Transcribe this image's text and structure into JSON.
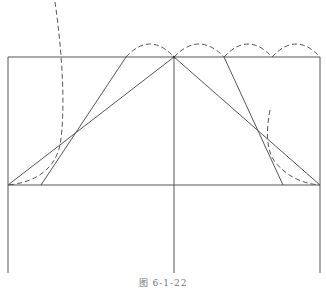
{
  "figure": {
    "caption": "图 6-1-22",
    "stroke_color": "#555555",
    "dash_color": "#555555",
    "frame": {
      "left": 8,
      "right": 320,
      "top": 57,
      "baseline": 185,
      "bottom": 273,
      "center_x": 174
    },
    "solid_lines": [
      {
        "name": "outer-left-slope",
        "x1": 8,
        "y1": 185,
        "x2": 174,
        "y2": 57
      },
      {
        "name": "outer-right-slope",
        "x1": 174,
        "y1": 57,
        "x2": 320,
        "y2": 185
      },
      {
        "name": "inner-left-slope",
        "x1": 41,
        "y1": 185,
        "x2": 126,
        "y2": 57
      },
      {
        "name": "inner-right-slope",
        "x1": 224,
        "y1": 57,
        "x2": 283,
        "y2": 185
      }
    ],
    "dashed_arcs": [
      {
        "x1": 126,
        "x2": 174,
        "peak_y": 44
      },
      {
        "x1": 174,
        "x2": 224,
        "peak_y": 44
      },
      {
        "x1": 224,
        "x2": 272,
        "peak_y": 44
      },
      {
        "x1": 272,
        "x2": 320,
        "peak_y": 44
      }
    ]
  }
}
